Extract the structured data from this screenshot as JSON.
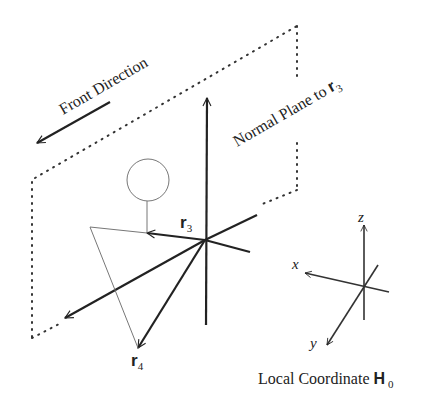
{
  "diagram": {
    "labels": {
      "front_direction": "Front Direction",
      "normal_plane": "Normal Plane to ",
      "normal_plane_vector": "r",
      "normal_plane_sub": "3",
      "r3_vector": "r",
      "r3_sub": "3",
      "r4_vector": "r",
      "r4_sub": "4",
      "local_coord": "Local Coordinate ",
      "local_coord_symbol": "H",
      "local_coord_sub": "0",
      "axis_x": "x",
      "axis_y": "y",
      "axis_z": "z"
    },
    "colors": {
      "stroke": "#222222",
      "thin_stroke": "#777777",
      "background": "#ffffff"
    }
  }
}
